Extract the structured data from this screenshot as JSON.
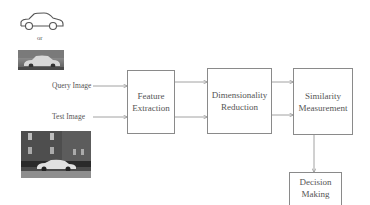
{
  "diagram": {
    "inputs": {
      "sketch_icon": "car-outline-sketch",
      "or_label": "or",
      "query_photo": "grayscale car photo (query)",
      "query_label": "Query Image",
      "test_label": "Test Image",
      "test_photo": "grayscale car photo in front of brick building (test)"
    },
    "nodes": [
      {
        "id": "feature_extraction",
        "line1": "Feature",
        "line2": "Extraction"
      },
      {
        "id": "dimensionality_reduction",
        "line1": "Dimensionality",
        "line2": "Reduction"
      },
      {
        "id": "similarity_measurement",
        "line1": "Similarity",
        "line2": "Measurement"
      },
      {
        "id": "decision_making",
        "line1": "Decision",
        "line2": "Making"
      }
    ],
    "edges": [
      {
        "from": "Query Image",
        "to": "feature_extraction"
      },
      {
        "from": "Test Image",
        "to": "feature_extraction"
      },
      {
        "from": "feature_extraction",
        "to": "dimensionality_reduction",
        "count": 2
      },
      {
        "from": "dimensionality_reduction",
        "to": "similarity_measurement",
        "count": 2
      },
      {
        "from": "similarity_measurement",
        "to": "decision_making"
      }
    ],
    "colors": {
      "line": "#8a8a8a",
      "text": "#555555",
      "background": "#ffffff"
    }
  }
}
